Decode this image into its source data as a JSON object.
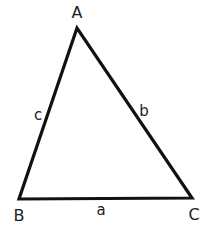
{
  "diagram": {
    "type": "triangle",
    "stroke_color": "#111111",
    "background": "#ffffff",
    "vertices": {
      "A": {
        "label": "A",
        "x": 77,
        "y": 28
      },
      "B": {
        "label": "B",
        "x": 19,
        "y": 199
      },
      "C": {
        "label": "C",
        "x": 192,
        "y": 198
      }
    },
    "sides": {
      "a": {
        "label": "a",
        "between": [
          "B",
          "C"
        ]
      },
      "b": {
        "label": "b",
        "between": [
          "A",
          "C"
        ]
      },
      "c": {
        "label": "c",
        "between": [
          "A",
          "B"
        ]
      }
    }
  }
}
